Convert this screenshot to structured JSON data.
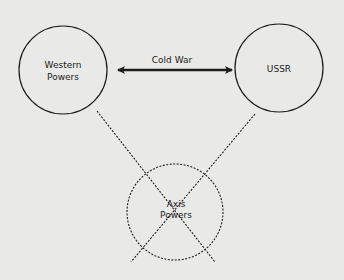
{
  "diagram": {
    "nodes": [
      {
        "id": "western",
        "line1": "Western",
        "line2": "Powers"
      },
      {
        "id": "ussr",
        "line1": "USSR"
      },
      {
        "id": "axis",
        "line1": "Axis",
        "line2": "Powers"
      }
    ],
    "edges": [
      {
        "from": "western",
        "to": "ussr",
        "label": "Cold War",
        "style": "solid-double-arrow"
      },
      {
        "from": "western",
        "to": "axis",
        "style": "dashed"
      },
      {
        "from": "ussr",
        "to": "axis",
        "style": "dashed"
      }
    ],
    "colors": {
      "background": "#e9e9e7",
      "stroke": "#1c1c1c"
    }
  }
}
